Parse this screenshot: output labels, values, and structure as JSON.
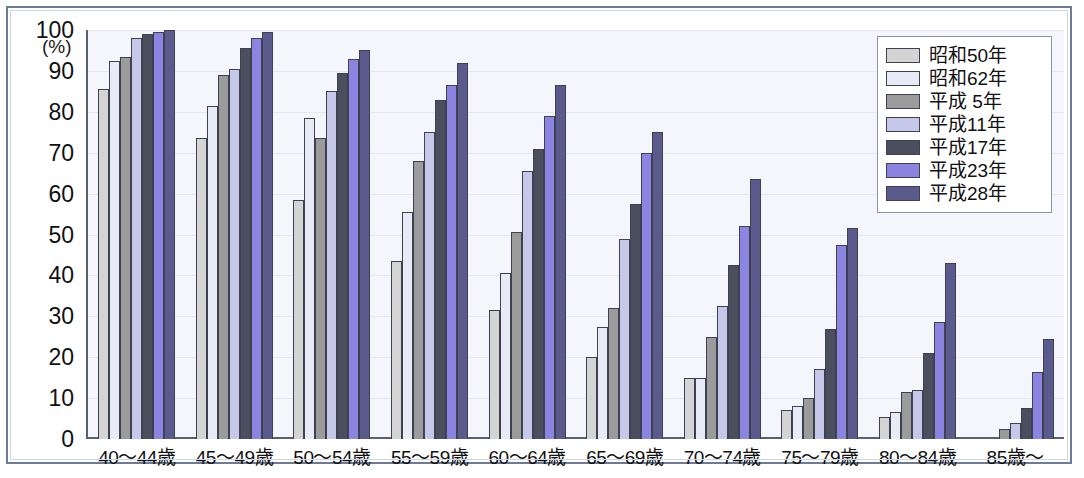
{
  "chart_data": {
    "type": "bar",
    "title": "",
    "xlabel": "",
    "ylabel": "",
    "yunit": "(%)",
    "ylim": [
      0,
      100
    ],
    "ytick_step": 10,
    "yticks": [
      "100",
      "90",
      "80",
      "70",
      "60",
      "50",
      "40",
      "30",
      "20",
      "10",
      "0"
    ],
    "grid": true,
    "legend_position": "top-right",
    "categories": [
      "40〜44歳",
      "45〜49歳",
      "50〜54歳",
      "55〜59歳",
      "60〜64歳",
      "65〜69歳",
      "70〜74歳",
      "75〜79歳",
      "80〜84歳",
      "85歳〜"
    ],
    "series": [
      {
        "name": "昭和50年",
        "color": "#d4d4d4",
        "values": [
          85.5,
          73.5,
          58.5,
          43.5,
          31.5,
          20.0,
          15.0,
          7.0,
          5.5,
          0.0
        ]
      },
      {
        "name": "昭和62年",
        "color": "#e8eaf6",
        "values": [
          92.5,
          81.5,
          78.5,
          55.5,
          40.5,
          27.5,
          15.0,
          8.0,
          6.5,
          0.0
        ]
      },
      {
        "name": "平成 5年",
        "color": "#9b9b9b",
        "values": [
          93.5,
          89.0,
          73.5,
          68.0,
          50.5,
          32.0,
          25.0,
          10.0,
          11.5,
          2.5
        ]
      },
      {
        "name": "平成11年",
        "color": "#c6c8ea",
        "values": [
          98.0,
          90.5,
          85.0,
          75.0,
          65.5,
          49.0,
          32.5,
          17.0,
          12.0,
          4.0
        ]
      },
      {
        "name": "平成17年",
        "color": "#4b4e5c",
        "values": [
          99.0,
          95.5,
          89.5,
          83.0,
          71.0,
          57.5,
          42.5,
          27.0,
          21.0,
          7.5
        ]
      },
      {
        "name": "平成23年",
        "color": "#8b84e0",
        "values": [
          99.5,
          98.0,
          93.0,
          86.5,
          79.0,
          70.0,
          52.0,
          47.5,
          28.5,
          16.5
        ]
      },
      {
        "name": "平成28年",
        "color": "#5b5a8c",
        "values": [
          100.0,
          99.5,
          95.0,
          92.0,
          86.5,
          75.0,
          63.5,
          51.5,
          43.0,
          24.5
        ]
      }
    ]
  }
}
